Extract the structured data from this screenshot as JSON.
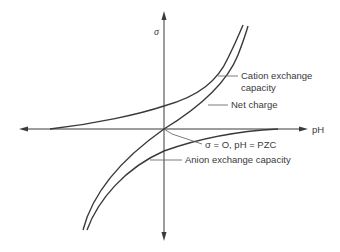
{
  "diagram": {
    "axes": {
      "y_label": "σ",
      "x_label": "pH"
    },
    "curves": [
      {
        "id": "cation",
        "label_line1": "Cation exchange",
        "label_line2": "capacity"
      },
      {
        "id": "net",
        "label": "Net charge"
      },
      {
        "id": "anion",
        "label": "Anion exchange capacity"
      }
    ],
    "annotation": {
      "pzc": "σ = O, pH = PZC"
    },
    "colors": {
      "line": "#3a3a3a",
      "background": "#ffffff"
    }
  }
}
